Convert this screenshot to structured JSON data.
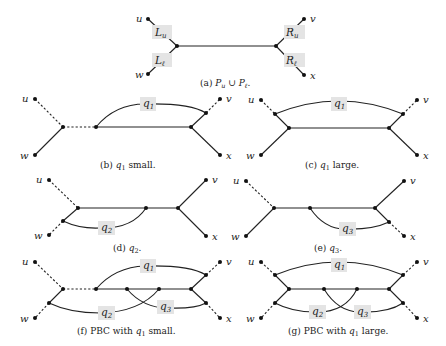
{
  "figure": {
    "panels": [
      {
        "id": "a",
        "caption": "(a) P",
        "caption_math": "P_u ∪ P_ℓ.",
        "caption_prefix": "(a) ",
        "caption_sub1": "u",
        "caption_mid": " ∪ P",
        "caption_sub2": "ℓ",
        "caption_end": ".",
        "vertices": [
          "u",
          "v",
          "w",
          "x"
        ],
        "labels": [
          {
            "main": "L",
            "sub": "u"
          },
          {
            "main": "L",
            "sub": "ℓ"
          },
          {
            "main": "R",
            "sub": "u"
          },
          {
            "main": "R",
            "sub": "ℓ"
          }
        ]
      },
      {
        "id": "b",
        "caption_prefix": "(b) ",
        "caption_var": "q",
        "caption_sub": "1",
        "caption_rest": " small.",
        "vertices": [
          "u",
          "v",
          "w",
          "x"
        ],
        "labels": [
          {
            "main": "q",
            "sub": "1"
          }
        ]
      },
      {
        "id": "c",
        "caption_prefix": "(c) ",
        "caption_var": "q",
        "caption_sub": "1",
        "caption_rest": " large.",
        "vertices": [
          "u",
          "v",
          "w",
          "x"
        ],
        "labels": [
          {
            "main": "q",
            "sub": "1"
          }
        ]
      },
      {
        "id": "d",
        "caption_prefix": "(d) ",
        "caption_var": "q",
        "caption_sub": "2",
        "caption_rest": ".",
        "vertices": [
          "u",
          "v",
          "w",
          "x"
        ],
        "labels": [
          {
            "main": "q",
            "sub": "2"
          }
        ]
      },
      {
        "id": "e",
        "caption_prefix": "(e) ",
        "caption_var": "q",
        "caption_sub": "3",
        "caption_rest": ".",
        "vertices": [
          "u",
          "v",
          "w",
          "x"
        ],
        "labels": [
          {
            "main": "q",
            "sub": "3"
          }
        ]
      },
      {
        "id": "f",
        "caption_prefix": "(f) PBC with ",
        "caption_var": "q",
        "caption_sub": "1",
        "caption_rest": " small.",
        "vertices": [
          "u",
          "v",
          "w",
          "x"
        ],
        "labels": [
          {
            "main": "q",
            "sub": "1"
          },
          {
            "main": "q",
            "sub": "2"
          },
          {
            "main": "q",
            "sub": "3"
          }
        ]
      },
      {
        "id": "g",
        "caption_prefix": "(g) PBC with ",
        "caption_var": "q",
        "caption_sub": "1",
        "caption_rest": " large.",
        "vertices": [
          "u",
          "v",
          "w",
          "x"
        ],
        "labels": [
          {
            "main": "q",
            "sub": "1"
          },
          {
            "main": "q",
            "sub": "2"
          },
          {
            "main": "q",
            "sub": "3"
          }
        ]
      }
    ],
    "colors": {
      "line": "#222222",
      "node": "#111111",
      "label_background": "#e4e4e4"
    }
  }
}
